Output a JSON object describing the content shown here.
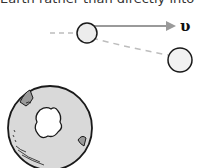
{
  "caption": "Earth rather than directly into it.",
  "diagram": {
    "velocity_label": "υ",
    "colors": {
      "stroke": "#1a1a1a",
      "fill_light": "#ececec",
      "arrow": "#9a9a9a",
      "dash": "#bdbdbd",
      "earth_fill": "#d9d9d9"
    },
    "objects": [
      {
        "name": "object-initial",
        "cx": 87,
        "cy": 33,
        "r": 10
      },
      {
        "name": "object-deflected",
        "cx": 180,
        "cy": 60,
        "r": 12
      }
    ],
    "earth": {
      "cx": 50,
      "cy": 128,
      "r": 42
    }
  }
}
